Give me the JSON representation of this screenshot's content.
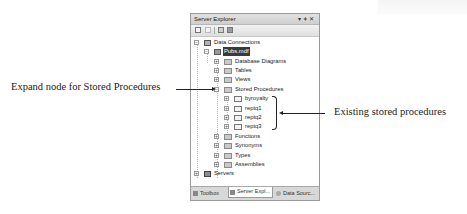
{
  "panel": {
    "title": "Server Explorer",
    "title_controls": "▾ ⊣ ✕",
    "toolbar_buttons": [
      "refresh-icon",
      "stop-icon",
      "connect-database-icon",
      "connect-server-icon"
    ],
    "tree": [
      {
        "label": "Data Connections",
        "level": 0,
        "expander": "minus",
        "icon": "data-connections-icon"
      },
      {
        "label": "Pubs.mdf",
        "level": 1,
        "expander": "minus",
        "icon": "database-icon",
        "selected": true
      },
      {
        "label": "Database Diagrams",
        "level": 2,
        "expander": "plus",
        "icon": "folder-icon"
      },
      {
        "label": "Tables",
        "level": 2,
        "expander": "plus",
        "icon": "folder-icon"
      },
      {
        "label": "Views",
        "level": 2,
        "expander": "plus",
        "icon": "folder-icon"
      },
      {
        "label": "Stored Procedures",
        "level": 2,
        "expander": "minus",
        "icon": "folder-icon"
      },
      {
        "label": "byroyalty",
        "level": 3,
        "expander": "plus",
        "icon": "stored-procedure-icon"
      },
      {
        "label": "reptq1",
        "level": 3,
        "expander": "plus",
        "icon": "stored-procedure-icon"
      },
      {
        "label": "reptq2",
        "level": 3,
        "expander": "plus",
        "icon": "stored-procedure-icon"
      },
      {
        "label": "reptq3",
        "level": 3,
        "expander": "plus",
        "icon": "stored-procedure-icon"
      },
      {
        "label": "Functions",
        "level": 2,
        "expander": "plus",
        "icon": "folder-icon"
      },
      {
        "label": "Synonyms",
        "level": 2,
        "expander": "plus",
        "icon": "folder-icon"
      },
      {
        "label": "Types",
        "level": 2,
        "expander": "plus",
        "icon": "folder-icon"
      },
      {
        "label": "Assemblies",
        "level": 2,
        "expander": "plus",
        "icon": "folder-icon"
      },
      {
        "label": "Servers",
        "level": 0,
        "expander": "plus",
        "icon": "servers-icon"
      }
    ],
    "tabs": [
      {
        "label": "Toolbox",
        "icon": "toolbox-icon",
        "active": false
      },
      {
        "label": "Server Expl...",
        "icon": "server-explorer-icon",
        "active": true
      },
      {
        "label": "Data Sourc...",
        "icon": "data-sources-icon",
        "active": false
      }
    ]
  },
  "callouts": {
    "left": "Expand node for Stored Procedures",
    "right": "Existing stored procedures"
  }
}
